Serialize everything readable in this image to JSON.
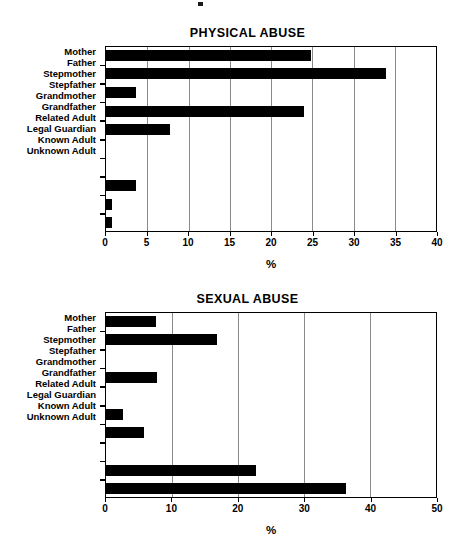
{
  "page": {
    "background": "#ffffff",
    "bar_color": "#000000",
    "grid_color": "#8a8a8a",
    "axis_color": "#000000"
  },
  "charts": [
    {
      "id": "physical",
      "title": "PHYSICAL ABUSE",
      "xlabel": "%",
      "ylabel": "",
      "xlim": [
        0,
        40
      ],
      "xticks": [
        0,
        5,
        10,
        15,
        20,
        25,
        30,
        35,
        40
      ],
      "xtick_labels": [
        "0",
        "5",
        "10",
        "15",
        "20",
        "25",
        "30",
        "35",
        "40"
      ],
      "categories": [
        "Mother",
        "Father",
        "Stepmother",
        "Stepfather",
        "Grandmother",
        "Grandfather",
        "Related Adult",
        "Legal Guardian",
        "Known Adult",
        "Unknown Adult"
      ],
      "values": [
        24.8,
        33.8,
        3.7,
        24.0,
        7.8,
        0,
        0,
        3.7,
        0.9,
        0.9
      ]
    },
    {
      "id": "sexual",
      "title": "SEXUAL ABUSE",
      "xlabel": "%",
      "ylabel": "",
      "xlim": [
        0,
        50
      ],
      "xticks": [
        0,
        10,
        20,
        30,
        40,
        50
      ],
      "xtick_labels": [
        "0",
        "10",
        "20",
        "30",
        "40",
        "50"
      ],
      "categories": [
        "Mother",
        "Father",
        "Stepmother",
        "Stepfather",
        "Grandmother",
        "Grandfather",
        "Related Adult",
        "Legal Guardian",
        "Known Adult",
        "Unknown Adult"
      ],
      "values": [
        7.7,
        16.9,
        0,
        7.8,
        0,
        2.7,
        5.9,
        0,
        22.7,
        36.3
      ]
    }
  ],
  "chart_data": [
    {
      "type": "bar",
      "orientation": "horizontal",
      "title": "PHYSICAL ABUSE",
      "xlabel": "%",
      "ylabel": "",
      "xlim": [
        0,
        40
      ],
      "xticks": [
        0,
        5,
        10,
        15,
        20,
        25,
        30,
        35,
        40
      ],
      "grid": "vertical",
      "legend": "none",
      "categories": [
        "Mother",
        "Father",
        "Stepmother",
        "Stepfather",
        "Grandmother",
        "Grandfather",
        "Related Adult",
        "Legal Guardian",
        "Known Adult",
        "Unknown Adult"
      ],
      "values": [
        24.8,
        33.8,
        3.7,
        24.0,
        7.8,
        0,
        0,
        3.7,
        0.9,
        0.9
      ]
    },
    {
      "type": "bar",
      "orientation": "horizontal",
      "title": "SEXUAL ABUSE",
      "xlabel": "%",
      "ylabel": "",
      "xlim": [
        0,
        50
      ],
      "xticks": [
        0,
        10,
        20,
        30,
        40,
        50
      ],
      "grid": "vertical",
      "legend": "none",
      "categories": [
        "Mother",
        "Father",
        "Stepmother",
        "Stepfather",
        "Grandmother",
        "Grandfather",
        "Related Adult",
        "Legal Guardian",
        "Known Adult",
        "Unknown Adult"
      ],
      "values": [
        7.7,
        16.9,
        0,
        7.8,
        0,
        2.7,
        5.9,
        0,
        22.7,
        36.3
      ]
    }
  ]
}
